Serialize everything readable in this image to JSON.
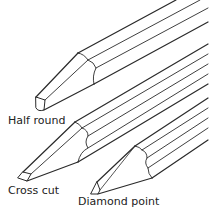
{
  "figure": {
    "line_color": "#2a2a2a",
    "background": "#ffffff"
  },
  "labels": {
    "half_round": "Half round",
    "cross_cut": "Cross cut",
    "diamond_point": "Diamond point"
  }
}
